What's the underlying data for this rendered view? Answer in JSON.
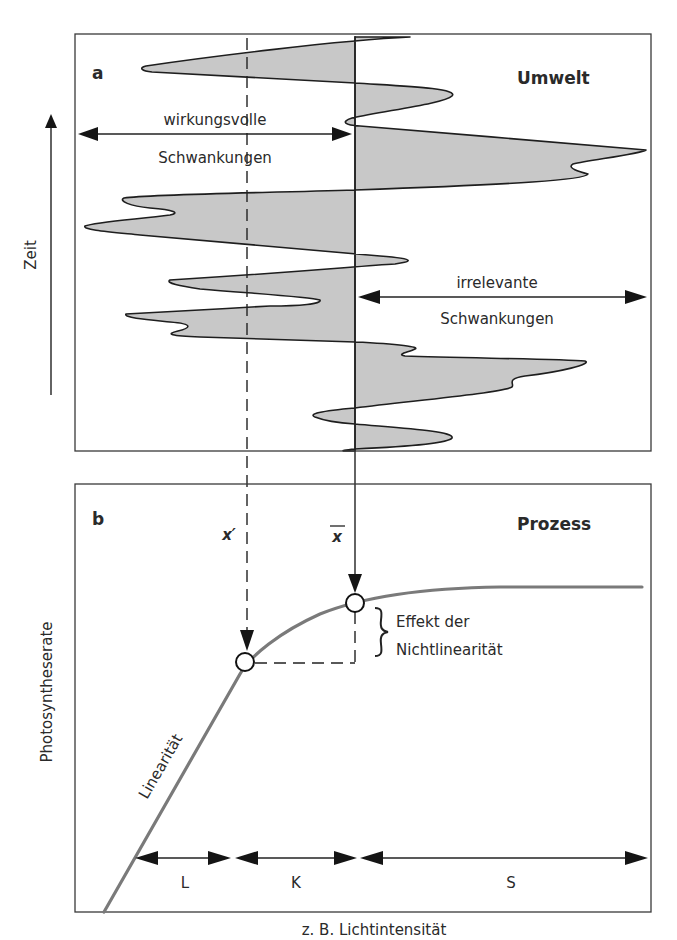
{
  "panel_a": {
    "letter": "a",
    "title": "Umwelt",
    "left_label_line1": "wirkungsvolle",
    "left_label_line2": "Schwankungen",
    "right_label_line1": "irrelevante",
    "right_label_line2": "Schwankungen",
    "y_axis_label": "Zeit"
  },
  "panel_b": {
    "letter": "b",
    "title": "Prozess",
    "marker_x_prime": "x′",
    "marker_x_bar": "x",
    "effect_line1": "Effekt der",
    "effect_line2": "Nichtlinearität",
    "curve_label": "Linearität",
    "y_axis_label": "Photosyntheserate",
    "x_axis_label": "z. B. Lichtintensität",
    "ranges": [
      "L",
      "K",
      "S"
    ]
  },
  "colors": {
    "fill": "#c8c8c8",
    "curve": "#7a7a7a",
    "ink": "#1e1e1e"
  }
}
